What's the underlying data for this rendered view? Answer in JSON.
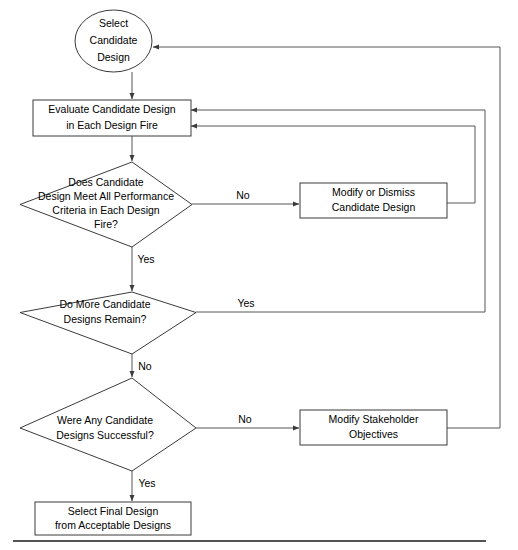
{
  "diagram": {
    "type": "flowchart",
    "colors": {
      "node_stroke": "#3b3b3b",
      "connector_stroke": "#575757",
      "node_fill": "#ffffff",
      "background": "#ffffff",
      "text": "#000000",
      "rule": "#1a1a1a"
    },
    "nodes": [
      {
        "id": "select-candidate-design",
        "shape": "ellipse",
        "lines": [
          "Select",
          "Candidate",
          "Design"
        ]
      },
      {
        "id": "evaluate-candidate-design",
        "shape": "rectangle",
        "lines": [
          "Evaluate Candidate Design",
          "in Each Design Fire"
        ]
      },
      {
        "id": "performance-criteria-decision",
        "shape": "diamond",
        "lines": [
          "Does Candidate",
          "Design Meet All Performance",
          "Criteria in Each Design",
          "Fire?"
        ]
      },
      {
        "id": "modify-or-dismiss-candidate-design",
        "shape": "rectangle",
        "lines": [
          "Modify or Dismiss",
          "Candidate Design"
        ]
      },
      {
        "id": "more-candidates-decision",
        "shape": "diamond",
        "lines": [
          "Do More Candidate",
          "Designs Remain?"
        ]
      },
      {
        "id": "any-successful-decision",
        "shape": "diamond",
        "lines": [
          "Were Any Candidate",
          "Designs Successful?"
        ]
      },
      {
        "id": "modify-stakeholder-objectives",
        "shape": "rectangle",
        "lines": [
          "Modify Stakeholder",
          "Objectives"
        ]
      },
      {
        "id": "select-final-design",
        "shape": "rectangle",
        "lines": [
          "Select Final Design",
          "from Acceptable Designs"
        ]
      }
    ],
    "edge_labels": {
      "criteria_no": "No",
      "criteria_yes": "Yes",
      "more_candidates_yes": "Yes",
      "more_candidates_no": "No",
      "successful_no": "No",
      "successful_yes": "Yes"
    }
  }
}
